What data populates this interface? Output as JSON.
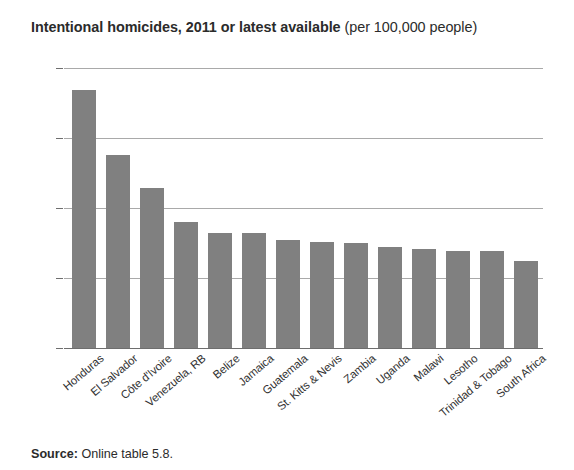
{
  "title": {
    "bold_part": "Intentional homicides, 2011 or latest available",
    "regular_part": " (per 100,000 people)"
  },
  "source": {
    "label": "Source:",
    "text": " Online table 5.8."
  },
  "colors": {
    "bar": "#808080",
    "gridline": "#a9a9a9",
    "axis": "#6e6e6e",
    "text": "#2b2b2b",
    "background": "#ffffff"
  },
  "chart_data": {
    "type": "bar",
    "title": "Intentional homicides, 2011 or latest available (per 100,000 people)",
    "subtitle": "",
    "xlabel": "",
    "ylabel": "",
    "unit": "per 100,000 people",
    "grid": true,
    "legend": false,
    "ylim": [
      0,
      100
    ],
    "yticks": [
      0,
      25,
      50,
      75,
      100
    ],
    "ytick_labels": [
      "0",
      "25",
      "50",
      "75",
      "100"
    ],
    "categories": [
      "Honduras",
      "El Salvador",
      "Côte d'Ivoire",
      "Venezuela, RB",
      "Belize",
      "Jamaica",
      "Guatemala",
      "St. Kitts & Nevis",
      "Zambia",
      "Uganda",
      "Malawi",
      "Lesotho",
      "Trinidad & Tobago",
      "South Africa"
    ],
    "values": [
      92,
      69,
      57,
      45,
      41,
      41,
      38.5,
      38,
      37.5,
      36,
      35.5,
      34.5,
      34.5,
      31
    ]
  }
}
